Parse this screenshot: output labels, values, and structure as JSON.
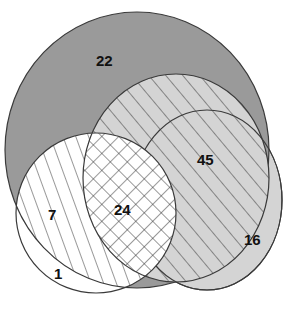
{
  "diagram": {
    "type": "venn",
    "sets": [
      {
        "id": "A",
        "name": "large-dark-gray-set",
        "fill": "#9a9a9a"
      },
      {
        "id": "B",
        "name": "diagonal-hatched-set",
        "fill": "#d4d4d4",
        "pattern": "diagonal"
      },
      {
        "id": "C",
        "name": "light-gray-set",
        "fill": "#d4d4d4"
      },
      {
        "id": "D",
        "name": "white-set",
        "fill": "#ffffff"
      }
    ],
    "regions": [
      {
        "id": "r22",
        "label": "22"
      },
      {
        "id": "r45",
        "label": "45"
      },
      {
        "id": "r24",
        "label": "24"
      },
      {
        "id": "r7",
        "label": "7"
      },
      {
        "id": "r16",
        "label": "16"
      },
      {
        "id": "r1",
        "label": "1"
      }
    ],
    "colors": {
      "stroke": "#3a3a3a",
      "hatch": "#333333"
    }
  }
}
